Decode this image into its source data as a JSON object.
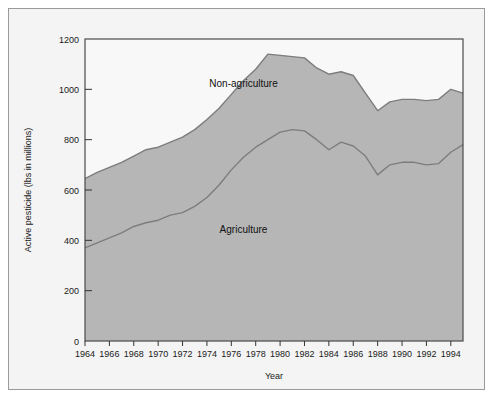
{
  "figure": {
    "background_color": "#f4f4f4",
    "plot_background_color": "#f8f8f8",
    "frame_color": "#9a9a9a"
  },
  "chart_data": {
    "type": "area",
    "stacked": true,
    "title": "",
    "subtitle": "",
    "xlabel": "Year",
    "ylabel": "Active pesticide (lbs in millions)",
    "xlim": [
      1964,
      1995
    ],
    "ylim": [
      0,
      1200
    ],
    "grid": false,
    "legend_position": "inline-annotation",
    "fill_color": "#b6b6b6",
    "line_color": "#7d7d7d",
    "x_ticks": [
      1964,
      1966,
      1968,
      1970,
      1972,
      1974,
      1976,
      1978,
      1980,
      1982,
      1984,
      1986,
      1988,
      1990,
      1992,
      1994
    ],
    "x_tick_labels": [
      "1964",
      "1966",
      "1968",
      "1970",
      "1972",
      "1974",
      "1976",
      "1978",
      "1980",
      "1982",
      "1984",
      "1986",
      "1988",
      "1990",
      "1992",
      "1994"
    ],
    "y_ticks": [
      0,
      200,
      400,
      600,
      800,
      1000,
      1200
    ],
    "y_tick_labels": [
      "0",
      "200",
      "400",
      "600",
      "800",
      "1000",
      "1200"
    ],
    "x": [
      1964,
      1965,
      1966,
      1967,
      1968,
      1969,
      1970,
      1971,
      1972,
      1973,
      1974,
      1975,
      1976,
      1977,
      1978,
      1979,
      1980,
      1981,
      1982,
      1983,
      1984,
      1985,
      1986,
      1987,
      1988,
      1989,
      1990,
      1991,
      1992,
      1993,
      1994,
      1995
    ],
    "series": [
      {
        "name": "Agriculture",
        "label": "Agriculture",
        "label_x": 1977,
        "label_y": 430,
        "values": [
          370,
          390,
          410,
          430,
          455,
          470,
          480,
          500,
          510,
          535,
          570,
          620,
          680,
          730,
          770,
          800,
          830,
          840,
          835,
          800,
          760,
          790,
          775,
          735,
          660,
          700,
          710,
          710,
          700,
          705,
          750,
          780
        ]
      },
      {
        "name": "Non-agriculture",
        "label": "Non-agriculture",
        "label_x": 1977,
        "label_y": 1010,
        "values": [
          275,
          280,
          280,
          280,
          280,
          290,
          290,
          290,
          300,
          305,
          310,
          305,
          300,
          305,
          310,
          340,
          305,
          290,
          290,
          285,
          300,
          280,
          280,
          250,
          255,
          250,
          250,
          250,
          255,
          255,
          250,
          205
        ]
      }
    ],
    "totals": [
      645,
      670,
      690,
      710,
      735,
      760,
      770,
      790,
      810,
      840,
      880,
      925,
      980,
      1035,
      1080,
      1140,
      1135,
      1130,
      1125,
      1085,
      1060,
      1070,
      1055,
      985,
      915,
      950,
      960,
      960,
      955,
      960,
      1000,
      985
    ],
    "annotations": [
      {
        "text": "Agriculture",
        "x": 1977,
        "y": 430
      },
      {
        "text": "Non-agriculture",
        "x": 1977,
        "y": 1010
      }
    ]
  }
}
